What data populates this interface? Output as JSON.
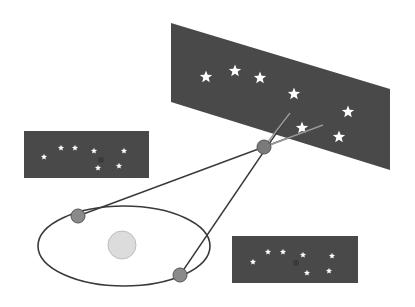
{
  "diagram": {
    "colors": {
      "background": "#ffffff",
      "sky_panel": "#4a4a4a",
      "star": "#ffffff",
      "line": "#3a3a3a",
      "earth": "#8a8a8a",
      "sun": "#dcdcdc",
      "nearby_star": "#7a7a7a"
    },
    "sky_panel_large": {
      "corners": [
        [
          171,
          23
        ],
        [
          390,
          89
        ],
        [
          390,
          170
        ],
        [
          171,
          102
        ]
      ],
      "stars": [
        [
          206,
          77
        ],
        [
          235,
          71
        ],
        [
          260,
          78
        ],
        [
          294,
          94
        ],
        [
          348,
          112
        ],
        [
          302,
          128
        ],
        [
          339,
          137
        ]
      ]
    },
    "sky_panel_left": {
      "x": 24,
      "y": 131,
      "w": 125,
      "h": 47,
      "stars": [
        [
          44,
          157
        ],
        [
          61,
          148
        ],
        [
          75,
          148
        ],
        [
          94,
          151
        ],
        [
          124,
          151
        ],
        [
          98,
          168
        ],
        [
          119,
          166
        ]
      ],
      "nearby_star_image": [
        101,
        160
      ]
    },
    "sky_panel_right": {
      "x": 232,
      "y": 236,
      "w": 126,
      "h": 47,
      "stars": [
        [
          253,
          262
        ],
        [
          268,
          252
        ],
        [
          283,
          252
        ],
        [
          303,
          255
        ],
        [
          332,
          256
        ],
        [
          307,
          273
        ],
        [
          329,
          271
        ]
      ],
      "nearby_star_image": [
        296,
        263
      ]
    },
    "orbit": {
      "cx": 124,
      "cy": 246,
      "rx": 86,
      "ry": 40
    },
    "sun": {
      "cx": 122,
      "cy": 245,
      "r": 14
    },
    "earth_positions": [
      {
        "label": "earth-january",
        "cx": 78,
        "cy": 216,
        "r": 7
      },
      {
        "label": "earth-july",
        "cx": 180,
        "cy": 275,
        "r": 7
      }
    ],
    "nearby_star": {
      "cx": 264,
      "cy": 147,
      "r": 7
    },
    "sight_lines": [
      {
        "from": [
          78,
          216
        ],
        "to": [
          323,
          125
        ]
      },
      {
        "from": [
          180,
          275
        ],
        "to": [
          290,
          113
        ]
      }
    ]
  }
}
